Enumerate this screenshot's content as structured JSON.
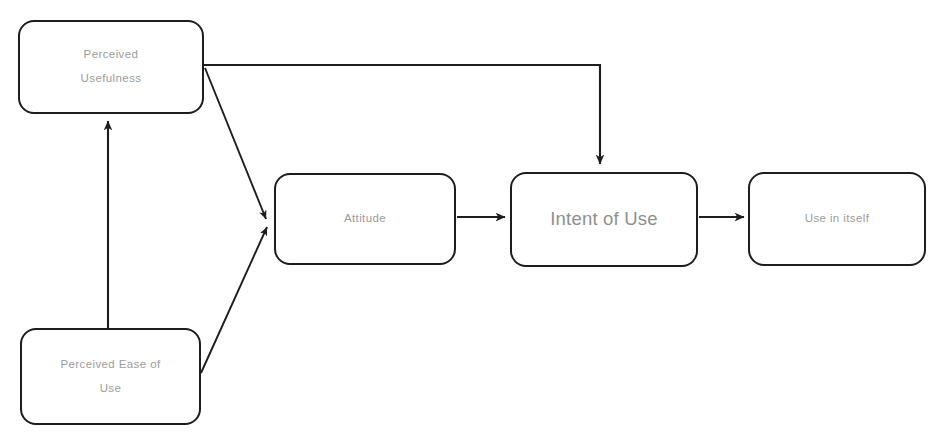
{
  "diagram": {
    "top_caption": "",
    "colors": {
      "stroke": "#1d1d1d",
      "text": "#9b9b9b",
      "text_emphasis": "#8f8f8f",
      "background": "#ffffff"
    },
    "nodes": [
      {
        "id": "perceived-usefulness",
        "label": "Perceived\nUsefulness",
        "x": 18,
        "y": 20,
        "w": 186,
        "h": 94,
        "emphasis": false
      },
      {
        "id": "perceived-ease-of-use",
        "label": "Perceived Ease of\nUse",
        "x": 20,
        "y": 328,
        "w": 181,
        "h": 97,
        "emphasis": false
      },
      {
        "id": "attitude",
        "label": "Attitude",
        "x": 274,
        "y": 173,
        "w": 182,
        "h": 92,
        "emphasis": false
      },
      {
        "id": "intent-of-use",
        "label": "Intent of Use",
        "x": 510,
        "y": 172,
        "w": 188,
        "h": 95,
        "emphasis": true
      },
      {
        "id": "use-in-itself",
        "label": "Use in itself",
        "x": 748,
        "y": 172,
        "w": 178,
        "h": 94,
        "emphasis": false
      }
    ],
    "edges": [
      {
        "id": "pu-to-intent",
        "from": "perceived-usefulness",
        "to": "intent-of-use",
        "style": "elbow",
        "label": ""
      },
      {
        "id": "pu-to-attitude",
        "from": "perceived-usefulness",
        "to": "attitude",
        "style": "diagonal",
        "label": ""
      },
      {
        "id": "peou-to-pu",
        "from": "perceived-ease-of-use",
        "to": "perceived-usefulness",
        "style": "vertical",
        "label": ""
      },
      {
        "id": "peou-to-attitude",
        "from": "perceived-ease-of-use",
        "to": "attitude",
        "style": "diagonal",
        "label": ""
      },
      {
        "id": "attitude-to-intent",
        "from": "attitude",
        "to": "intent-of-use",
        "style": "horizontal",
        "label": ""
      },
      {
        "id": "intent-to-use",
        "from": "intent-of-use",
        "to": "use-in-itself",
        "style": "horizontal",
        "label": ""
      }
    ]
  }
}
